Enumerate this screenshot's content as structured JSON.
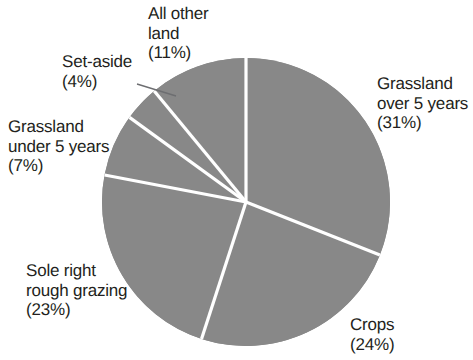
{
  "chart_data": {
    "type": "pie",
    "title": "Agricultural land use",
    "xlabel": "",
    "ylabel": "",
    "units": "percent",
    "grid": false,
    "legend": "none",
    "labels_position": "outside",
    "start_angle_deg": 0,
    "direction": "clockwise",
    "categories": [
      "Grassland over 5 years",
      "Crops",
      "Sole right rough grazing",
      "Grassland under 5 years",
      "Set-aside",
      "All other land"
    ],
    "values": [
      31,
      24,
      23,
      7,
      4,
      11
    ],
    "slices": [
      {
        "name": "Grassland over 5 years",
        "value": 31,
        "label": "Grassland\nover 5 years\n(31%)",
        "percent_text": "(31%)",
        "start_deg": 0,
        "end_deg": 111.6
      },
      {
        "name": "Crops",
        "value": 24,
        "label": "Crops\n(24%)",
        "percent_text": "(24%)",
        "start_deg": 111.6,
        "end_deg": 198.0
      },
      {
        "name": "Sole right rough grazing",
        "value": 23,
        "label": "Sole right\nrough grazing\n(23%)",
        "percent_text": "(23%)",
        "start_deg": 198.0,
        "end_deg": 280.8
      },
      {
        "name": "Grassland under 5 years",
        "value": 7,
        "label": "Grassland\nunder 5 years\n(7%)",
        "percent_text": "(7%)",
        "start_deg": 280.8,
        "end_deg": 306.0
      },
      {
        "name": "Set-aside",
        "value": 4,
        "label": "Set-aside\n(4%)",
        "percent_text": "(4%)",
        "start_deg": 306.0,
        "end_deg": 320.4
      },
      {
        "name": "All other land",
        "value": 11,
        "label": "All other\nland\n(11%)",
        "percent_text": "(11%)",
        "start_deg": 320.4,
        "end_deg": 360.0
      }
    ],
    "colors": {
      "slice_fill": "#888888",
      "slice_divider": "#ffffff",
      "label_text": "#231f20",
      "leader_line": "#6d6e71",
      "background": "#ffffff"
    },
    "geometry": {
      "center_x": 246,
      "center_y": 202,
      "radius": 144
    }
  },
  "labels": {
    "all_other_land": "All other\nland\n(11%)",
    "set_aside": "Set-aside\n(4%)",
    "grassland_under_5": "Grassland\nunder 5 years\n(7%)",
    "sole_right_rough_grazing": "Sole right\nrough grazing\n(23%)",
    "grassland_over_5": "Grassland\nover 5 years\n(31%)",
    "crops": "Crops\n(24%)"
  }
}
